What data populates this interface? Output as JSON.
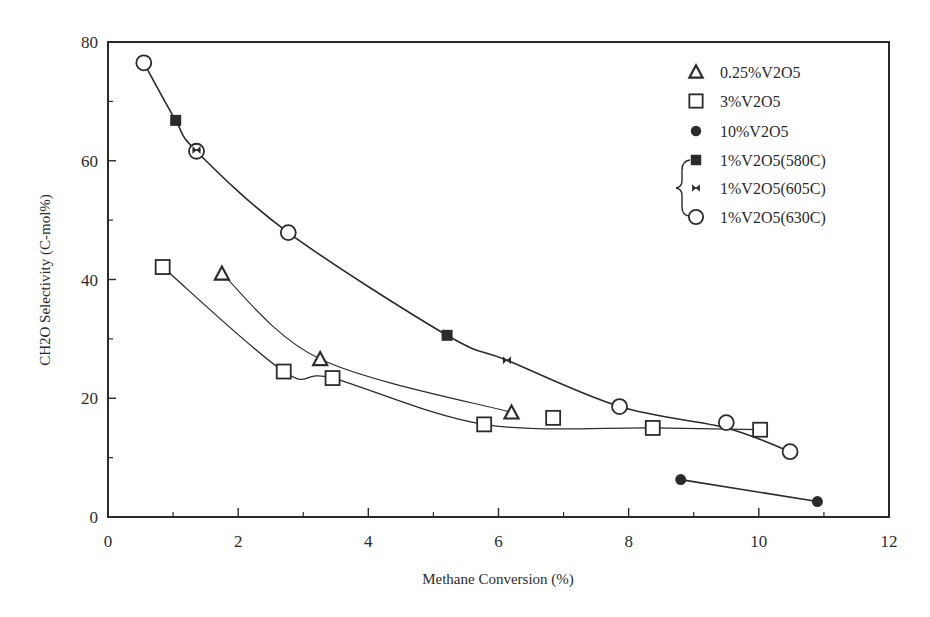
{
  "chart_data": {
    "type": "scatter",
    "title": "",
    "xlabel": "Methane Conversion (%)",
    "ylabel": "CH2O Selectivity (C-mol%)",
    "xlim": [
      0,
      12
    ],
    "ylim": [
      0,
      80
    ],
    "x_ticks": [
      0,
      2,
      4,
      6,
      8,
      10,
      12
    ],
    "x_minor_ticks": [
      1,
      3,
      5,
      7,
      9,
      11
    ],
    "y_ticks": [
      0,
      20,
      40,
      60,
      80
    ],
    "y_minor_ticks": [
      10,
      30,
      50,
      70
    ],
    "grid": false,
    "legend_position": "upper right (inside)",
    "series": [
      {
        "name": "0.25%V2O5",
        "marker": "open-triangle",
        "points": [
          [
            1.75,
            41.0
          ],
          [
            3.26,
            26.6
          ],
          [
            6.2,
            17.6
          ]
        ]
      },
      {
        "name": "3%V2O5",
        "marker": "open-square",
        "points": [
          [
            0.84,
            42.1
          ],
          [
            2.7,
            24.5
          ],
          [
            3.45,
            23.4
          ],
          [
            5.78,
            15.6
          ],
          [
            6.84,
            16.7
          ],
          [
            8.37,
            15.0
          ],
          [
            10.02,
            14.7
          ]
        ]
      },
      {
        "name": "10%V2O5",
        "marker": "filled-circle",
        "points": [
          [
            8.8,
            6.3
          ],
          [
            10.9,
            2.6
          ]
        ]
      },
      {
        "name": "1%V2O5(580C)",
        "marker": "filled-square",
        "points": [
          [
            1.04,
            66.8
          ],
          [
            5.21,
            30.6
          ]
        ]
      },
      {
        "name": "1%V2O5(605C)",
        "marker": "bowtie",
        "points": [
          [
            1.36,
            61.8
          ],
          [
            6.13,
            26.4
          ]
        ]
      },
      {
        "name": "1%V2O5(630C)",
        "marker": "open-circle",
        "points": [
          [
            0.55,
            76.5
          ],
          [
            1.36,
            61.6
          ],
          [
            2.77,
            47.9
          ],
          [
            7.86,
            18.6
          ],
          [
            9.5,
            15.9
          ],
          [
            10.48,
            11.0
          ]
        ]
      }
    ],
    "fit_curves": [
      {
        "name": "1%V2O5 (all temperatures)",
        "width": 1.6,
        "points": [
          [
            0.55,
            76.5
          ],
          [
            1.04,
            66.8
          ],
          [
            1.36,
            61.6
          ],
          [
            2.77,
            47.9
          ],
          [
            5.21,
            30.6
          ],
          [
            6.13,
            26.4
          ],
          [
            7.86,
            18.6
          ],
          [
            9.5,
            15.0
          ],
          [
            10.48,
            11.0
          ]
        ]
      },
      {
        "name": "0.25%V2O5",
        "width": 1.1,
        "points": [
          [
            1.75,
            41.0
          ],
          [
            3.26,
            26.6
          ],
          [
            6.2,
            17.6
          ]
        ]
      },
      {
        "name": "3%V2O5",
        "width": 1.3,
        "points": [
          [
            0.84,
            42.1
          ],
          [
            2.7,
            24.5
          ],
          [
            3.45,
            23.4
          ],
          [
            5.78,
            15.6
          ],
          [
            8.37,
            15.0
          ],
          [
            10.02,
            14.7
          ]
        ]
      },
      {
        "name": "10%V2O5",
        "width": 1.6,
        "points": [
          [
            8.8,
            6.3
          ],
          [
            10.9,
            2.6
          ]
        ]
      }
    ],
    "annotations": [
      "Brace grouping legend entries 1%V2O5(580C), 1%V2O5(605C), 1%V2O5(630C)"
    ]
  },
  "legend": {
    "items": [
      {
        "label": "0.25%V2O5",
        "marker": "open-triangle"
      },
      {
        "label": "3%V2O5",
        "marker": "open-square"
      },
      {
        "label": "10%V2O5",
        "marker": "filled-circle"
      },
      {
        "label": "1%V2O5(580C)",
        "marker": "filled-square"
      },
      {
        "label": "1%V2O5(605C)",
        "marker": "bowtie"
      },
      {
        "label": "1%V2O5(630C)",
        "marker": "open-circle"
      }
    ]
  },
  "colors": {
    "ink": "#2b2b2b",
    "background": "#ffffff"
  }
}
